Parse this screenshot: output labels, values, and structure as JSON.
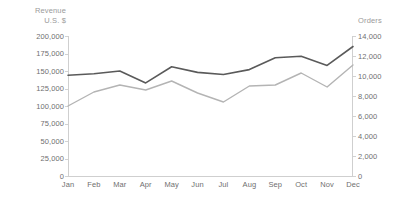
{
  "chart_data": {
    "type": "line",
    "title": "",
    "subtitle": "",
    "xlabel": "",
    "categories": [
      "Jan",
      "Feb",
      "Mar",
      "Apr",
      "May",
      "Jun",
      "Jul",
      "Aug",
      "Sep",
      "Oct",
      "Nov",
      "Dec"
    ],
    "grid": false,
    "legend_position": "none",
    "axes": {
      "left": {
        "label_line1": "Revenue",
        "label_line2": "U.S. $",
        "ticks": [
          "0",
          "25,000",
          "50,000",
          "75,000",
          "100,000",
          "125,000",
          "150,000",
          "175,000",
          "200,000"
        ],
        "tick_values": [
          0,
          25000,
          50000,
          75000,
          100000,
          125000,
          150000,
          175000,
          200000
        ],
        "ylim": [
          0,
          200000
        ]
      },
      "right": {
        "label_line1": "Orders",
        "ticks": [
          "0",
          "2,000",
          "4,000",
          "6,000",
          "8,000",
          "10,000",
          "12,000",
          "14,000"
        ],
        "tick_values": [
          0,
          2000,
          4000,
          6000,
          8000,
          10000,
          12000,
          14000
        ],
        "ylim": [
          0,
          14000
        ]
      }
    },
    "series": [
      {
        "name": "Revenue",
        "axis": "left",
        "color": "#5a5a5a",
        "values": [
          144000,
          146000,
          150000,
          133000,
          156000,
          148000,
          145000,
          152000,
          169000,
          171000,
          158000,
          185000
        ]
      },
      {
        "name": "Orders",
        "axis": "right",
        "color": "#b4b4b4",
        "values": [
          7000,
          8400,
          9100,
          8600,
          9500,
          8300,
          7400,
          9000,
          9100,
          10300,
          8900,
          11100
        ]
      }
    ]
  }
}
